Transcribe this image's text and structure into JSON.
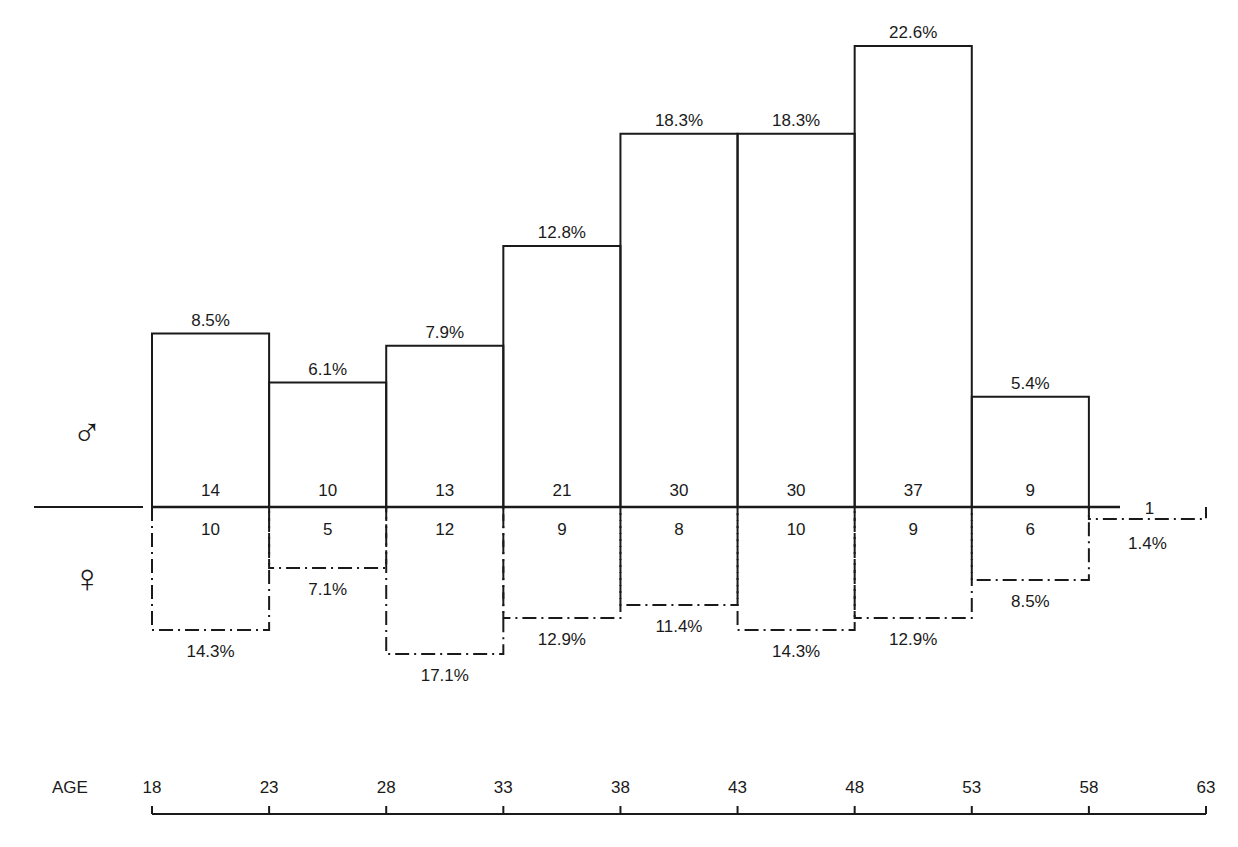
{
  "chart_data": {
    "type": "bar",
    "title": "",
    "xlabel": "AGE",
    "ylabel": "",
    "age_ticks": [
      18,
      23,
      28,
      33,
      38,
      43,
      48,
      53,
      58,
      63
    ],
    "categories": [
      "18-23",
      "23-28",
      "28-33",
      "33-38",
      "38-43",
      "43-48",
      "48-53",
      "53-58",
      "58-63"
    ],
    "series": [
      {
        "name": "Male",
        "symbol": "♂",
        "direction": "up",
        "line_style": "solid",
        "counts": [
          14,
          10,
          13,
          21,
          30,
          30,
          37,
          9,
          null
        ],
        "percentages": [
          8.5,
          6.1,
          7.9,
          12.8,
          18.3,
          18.3,
          22.6,
          5.4,
          null
        ],
        "labels": [
          "8.5%",
          "6.1%",
          "7.9%",
          "12.8%",
          "18.3%",
          "18.3%",
          "22.6%",
          "5.4%",
          null
        ]
      },
      {
        "name": "Female",
        "symbol": "♀",
        "direction": "down",
        "line_style": "dash-dot",
        "counts": [
          10,
          5,
          12,
          9,
          8,
          10,
          9,
          6,
          1
        ],
        "percentages": [
          14.3,
          7.1,
          17.1,
          12.9,
          11.4,
          14.3,
          12.9,
          8.5,
          1.4
        ],
        "labels": [
          "14.3%",
          "7.1%",
          "17.1%",
          "12.9%",
          "11.4%",
          "14.3%",
          "12.9%",
          "8.5%",
          "1.4%"
        ]
      }
    ],
    "legend": [
      "♂",
      "♀"
    ],
    "grid": false,
    "ylim": [
      0,
      23
    ]
  },
  "axis": {
    "label": "AGE"
  },
  "symbols": {
    "male": "♂",
    "female": "♀"
  }
}
